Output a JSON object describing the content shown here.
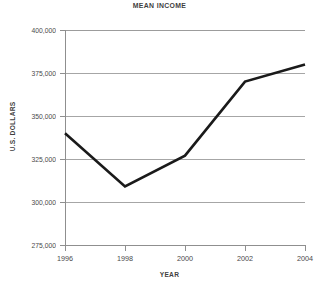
{
  "chart_data": {
    "type": "line",
    "title": "MEAN INCOME",
    "xlabel": "YEAR",
    "ylabel": "U.S. DOLLARS",
    "x": [
      1996,
      1998,
      2000,
      2002,
      2004
    ],
    "categories": [
      "1996",
      "1998",
      "2000",
      "2002",
      "2004"
    ],
    "values": [
      340000,
      309000,
      327000,
      370000,
      380000
    ],
    "series": [
      {
        "name": "Mean Income",
        "values": [
          340000,
          309000,
          327000,
          370000,
          380000
        ]
      }
    ],
    "xlim": [
      1996,
      2004
    ],
    "ylim": [
      275000,
      400000
    ],
    "y_ticks": [
      275000,
      300000,
      325000,
      350000,
      375000,
      400000
    ],
    "y_tick_labels": [
      "275,000",
      "300,000",
      "325,000",
      "350,000",
      "375,000",
      "400,000"
    ],
    "x_ticks": [
      1996,
      1998,
      2000,
      2002,
      2004
    ],
    "x_tick_labels": [
      "1996",
      "1998",
      "2000",
      "2002",
      "2004"
    ],
    "grid": true,
    "grid_axis": "y",
    "legend": false,
    "legend_position": "none",
    "line_color": "#1a1a1a",
    "grid_color": "#a6a6a6",
    "axis_color": "#8f8f8f",
    "background_color": "#ffffff",
    "text_color": "#3f3f3f"
  }
}
